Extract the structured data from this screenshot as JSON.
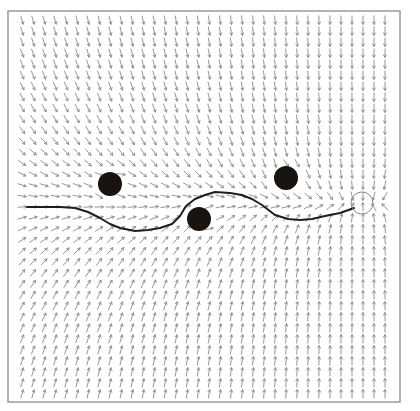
{
  "figure": {
    "title": "",
    "frame": {
      "x": 8,
      "y": 11,
      "width": 392,
      "height": 391,
      "stroke": "#9a9a9a"
    },
    "arrow_color": "#8a8a8a",
    "arrow_grid": {
      "x0": 22,
      "y0": 20,
      "dx": 11,
      "dy": 11,
      "length": 9
    },
    "field": {
      "vertical_weight": 6,
      "obstacle_strength": 2600,
      "obstacle_influence": 55
    }
  },
  "obstacles": [
    {
      "label": "obstacle-1",
      "cx": 110,
      "cy": 184,
      "r": 12,
      "color": "#1a1410"
    },
    {
      "label": "obstacle-2",
      "cx": 199,
      "cy": 219,
      "r": 12,
      "color": "#1a1410"
    },
    {
      "label": "obstacle-3",
      "cx": 286,
      "cy": 178,
      "r": 12,
      "color": "#1a1410"
    }
  ],
  "goal": {
    "label": "goal",
    "cx": 362,
    "cy": 203,
    "r": 11,
    "stroke": "#8a8a8a"
  },
  "path": {
    "label": "robot-path",
    "color": "#1e1e1e",
    "points": [
      [
        27,
        207
      ],
      [
        45,
        207
      ],
      [
        60,
        207
      ],
      [
        75,
        208
      ],
      [
        88,
        212
      ],
      [
        100,
        218
      ],
      [
        110,
        224
      ],
      [
        120,
        228
      ],
      [
        135,
        231
      ],
      [
        148,
        230
      ],
      [
        160,
        228
      ],
      [
        172,
        224
      ],
      [
        180,
        216
      ],
      [
        186,
        206
      ],
      [
        195,
        199
      ],
      [
        205,
        195
      ],
      [
        215,
        192
      ],
      [
        230,
        193
      ],
      [
        242,
        195
      ],
      [
        252,
        199
      ],
      [
        262,
        205
      ],
      [
        275,
        215
      ],
      [
        288,
        219
      ],
      [
        300,
        220
      ],
      [
        312,
        219
      ],
      [
        325,
        216
      ],
      [
        340,
        213
      ],
      [
        354,
        208
      ]
    ]
  }
}
